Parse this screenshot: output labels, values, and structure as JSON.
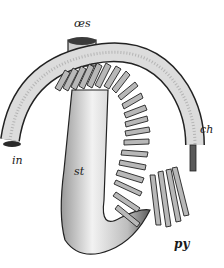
{
  "figure": {
    "colors": {
      "ink": "#1a1a1a",
      "shade": "#6e6e6e",
      "light": "#d8d8d8",
      "paper": "#ffffff"
    },
    "labels": {
      "oesophagus": "œs",
      "intestine": "in",
      "stomach": "st",
      "ch": "ch",
      "pyloric_caeca": "py"
    }
  }
}
